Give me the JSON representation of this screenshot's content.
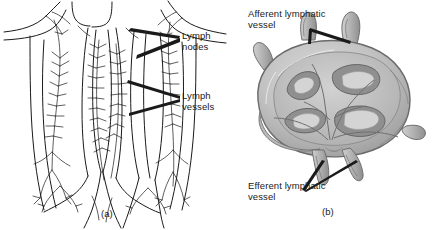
{
  "figure": {
    "type": "anatomical-illustration",
    "background_color": "#ffffff",
    "line_color": "#1a1a1a",
    "panels": [
      {
        "id": "a",
        "caption": "(a)",
        "subject": "lymphatic vessels and lymph nodes of the trunk",
        "style": "black-and-white line drawing",
        "labels": [
          {
            "name": "lymph-nodes",
            "line1": "Lymph",
            "line2": "nodes",
            "leader": "two-pronged wedge pointing left"
          },
          {
            "name": "lymph-vessels",
            "line1": "Lymph",
            "line2": "vessels",
            "leader": "two-pronged wedge pointing left"
          }
        ]
      },
      {
        "id": "b",
        "caption": "(b)",
        "subject": "cross-section of a single lymph node",
        "style": "grayscale shaded drawing",
        "labels": [
          {
            "name": "afferent-lymphatic-vessel",
            "line1": "Afferent lymphatic",
            "line2": "vessel",
            "leader": "two-pronged wedge pointing up-right"
          },
          {
            "name": "efferent-lymphatic-vessel",
            "line1": "Efferent lymphatic",
            "line2": "vessel",
            "leader": "two-pronged wedge pointing up-right"
          }
        ]
      }
    ],
    "colors": {
      "ink": "#1a1a1a",
      "node_outline": "#6e6e6e",
      "node_light": "#d8d8d8",
      "node_mid": "#b4b4b4",
      "node_dark": "#8a8a8a",
      "node_darkest": "#6a6a6a"
    }
  }
}
